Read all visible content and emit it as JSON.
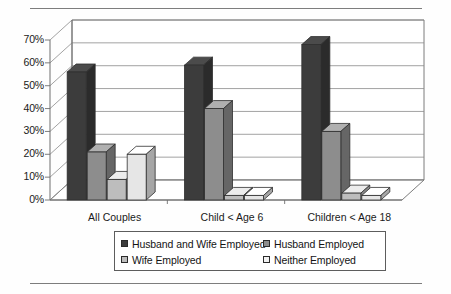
{
  "chart_data": {
    "type": "bar",
    "title": "",
    "subtitle": "",
    "xlabel": "",
    "ylabel": "",
    "categories": [
      "All Couples",
      "Child < Age 6",
      "Children < Age 18"
    ],
    "series": [
      {
        "name": "Husband and Wife Employed",
        "color": "#3c3c3c",
        "values": [
          56,
          59,
          68
        ]
      },
      {
        "name": "Husband Employed",
        "color": "#8d8d8d",
        "values": [
          21,
          40,
          30
        ]
      },
      {
        "name": "Wife Employed",
        "color": "#bdbdbd",
        "values": [
          9,
          2,
          3
        ]
      },
      {
        "name": "Neither Employed",
        "color": "#e6e6e6",
        "values": [
          20,
          2,
          2
        ]
      }
    ],
    "ylim": [
      0,
      70
    ],
    "ytick_values": [
      0,
      10,
      20,
      30,
      40,
      50,
      60,
      70
    ],
    "ytick_labels": [
      "0%",
      "10%",
      "20%",
      "30%",
      "40%",
      "50%",
      "60%",
      "70%"
    ],
    "grid": true,
    "grid_axis": "y",
    "legend_position": "bottom",
    "three_d": true,
    "annotations": []
  },
  "axis": {
    "y": {
      "ticks": [
        {
          "label": "70%",
          "value": 70
        },
        {
          "label": "60%",
          "value": 60
        },
        {
          "label": "50%",
          "value": 50
        },
        {
          "label": "40%",
          "value": 40
        },
        {
          "label": "30%",
          "value": 30
        },
        {
          "label": "20%",
          "value": 20
        },
        {
          "label": "10%",
          "value": 10
        },
        {
          "label": "0%",
          "value": 0
        }
      ]
    },
    "x": {
      "ticks": [
        {
          "label": "All Couples"
        },
        {
          "label": "Child < Age 6"
        },
        {
          "label": "Children < Age 18"
        }
      ]
    }
  },
  "legend": {
    "entries": [
      {
        "label": "Husband and Wife Employed",
        "color": "#3c3c3c"
      },
      {
        "label": "Husband Employed",
        "color": "#8d8d8d"
      },
      {
        "label": "Wife Employed",
        "color": "#bdbdbd"
      },
      {
        "label": "Neither Employed",
        "color": "#f2f2f2"
      }
    ]
  }
}
